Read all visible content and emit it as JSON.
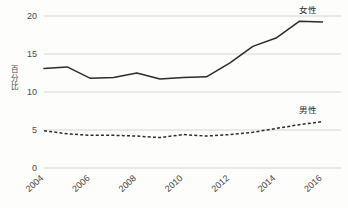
{
  "chart_data": {
    "type": "line",
    "title": "",
    "subtitle": "",
    "xlabel": "",
    "ylabel": "百分比",
    "ylim": [
      0,
      20
    ],
    "xlim": [
      2004,
      2016.8
    ],
    "grid": true,
    "legend_position": "inline-right",
    "y_ticks": [
      "0",
      "5",
      "10",
      "15",
      "20"
    ],
    "y_tick_values": [
      0,
      5,
      10,
      15,
      20
    ],
    "x_ticks": [
      "2004",
      "2006",
      "2008",
      "2010",
      "2012",
      "2014",
      "2016"
    ],
    "x_tick_values": [
      2004,
      2006,
      2008,
      2010,
      2012,
      2014,
      2016
    ],
    "x": [
      2004,
      2005,
      2006,
      2007,
      2008,
      2009,
      2010,
      2011,
      2012,
      2013,
      2014,
      2015,
      2016
    ],
    "series": [
      {
        "name": "女性",
        "label": "女性",
        "style": "solid",
        "color": "#2b2b2b",
        "values": [
          13.1,
          13.3,
          11.8,
          11.9,
          12.5,
          11.7,
          11.9,
          12.0,
          13.8,
          16.0,
          17.1,
          19.3,
          19.2
        ]
      },
      {
        "name": "男性",
        "label": "男性",
        "style": "dashed",
        "color": "#2b2b2b",
        "values": [
          4.9,
          4.5,
          4.3,
          4.3,
          4.2,
          4.0,
          4.4,
          4.2,
          4.4,
          4.7,
          5.2,
          5.7,
          6.1
        ]
      }
    ]
  },
  "axis": {
    "y_title": "百分比"
  }
}
